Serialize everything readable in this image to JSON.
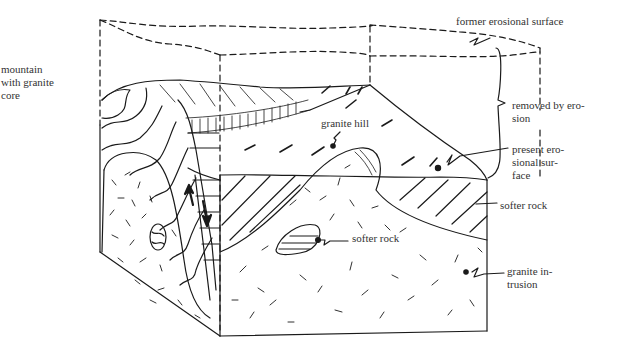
{
  "figure": {
    "colors": {
      "ink": "#1a1a1a",
      "label": "#333333",
      "background": "#ffffff"
    }
  },
  "labels": {
    "mountain": "mountain\nwith granite\ncore",
    "former_surface": "former erosional surface",
    "removed": "removed by ero-\nsion",
    "present_surface": "present ero-\nsional sur-\nface",
    "softer_rock_right": "softer rock",
    "granite_hill": "granite hill",
    "softer_rock_middle": "softer rock",
    "granite_intrusion": "granite in-\ntrusion"
  }
}
